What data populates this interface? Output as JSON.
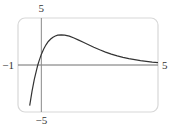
{
  "chart_data": {
    "type": "line",
    "title": "",
    "xlabel": "",
    "ylabel": "",
    "xlim": [
      -1,
      5
    ],
    "ylim": [
      -5,
      5
    ],
    "grid": false,
    "legend": null,
    "tick_labels": {
      "x_min": "−1",
      "x_max": "5",
      "y_max": "5",
      "y_min": "−5"
    },
    "series": [
      {
        "name": "f(x)",
        "x": [
          -0.5,
          -0.4,
          -0.3,
          -0.2,
          -0.15,
          -0.1,
          0,
          0.1,
          0.2,
          0.3,
          0.4,
          0.5,
          0.6,
          0.7,
          0.85,
          1.0,
          1.2,
          1.4,
          1.6,
          1.8,
          2.0,
          2.25,
          2.5,
          2.75,
          3.0,
          3.25,
          3.5,
          3.75,
          4.0,
          4.25,
          4.5,
          4.75,
          5.0
        ],
        "y": [
          -4.33,
          -2.8,
          -1.52,
          -0.46,
          0.0,
          0.41,
          1.13,
          1.7,
          2.15,
          2.5,
          2.77,
          2.96,
          3.09,
          3.17,
          3.2,
          3.17,
          3.06,
          2.87,
          2.65,
          2.41,
          2.18,
          1.88,
          1.62,
          1.37,
          1.16,
          0.97,
          0.81,
          0.67,
          0.56,
          0.46,
          0.38,
          0.31,
          0.26
        ]
      }
    ],
    "colors": {
      "curve": "#333333",
      "axes": "#6e6e6e",
      "frame": "#d8d8d8"
    }
  }
}
